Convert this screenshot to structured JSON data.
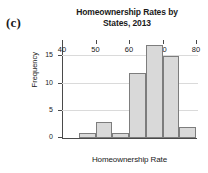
{
  "panel": {
    "label": "(c)"
  },
  "chart_data": {
    "type": "bar",
    "title": "Homeownership Rates by States, 2013",
    "title_line1": "Homeownership Rates by",
    "title_line2": "States, 2013",
    "xlabel": "Homeownership Rate",
    "ylabel": "Frequency",
    "bin_width": 5,
    "bin_edges": [
      45,
      50,
      55,
      60,
      65,
      70,
      75,
      80
    ],
    "categories": [
      "45-50",
      "50-55",
      "55-60",
      "60-65",
      "65-70",
      "70-75",
      "75-80"
    ],
    "values": [
      1,
      3,
      1,
      12,
      17,
      15,
      2
    ],
    "xlim": [
      40,
      80
    ],
    "ylim": [
      0,
      18
    ],
    "xticks": [
      40,
      50,
      60,
      70,
      80
    ],
    "yticks": [
      0,
      5,
      10,
      15
    ],
    "grid": true,
    "legend": null,
    "bar_fill": "#d9d9d9",
    "bar_edge": "#7d7d7d",
    "grid_color": "#dadada",
    "axis_color": "#4a4a4a"
  }
}
